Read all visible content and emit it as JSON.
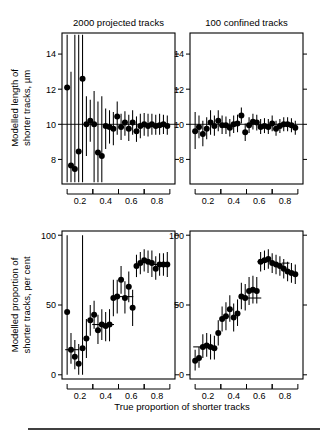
{
  "figure": {
    "xlabel": "True proportion of shorter tracks",
    "ylabel_top": "Modelled length of\nshorter tracks, µm",
    "ylabel_top_line1": "Modelled length of",
    "ylabel_top_line2": "shorter tracks, µm",
    "ylabel_bottom_line1": "Modelled proportion of",
    "ylabel_bottom_line2": "shorter tracks, per cent",
    "x_tick_labels": [
      "0.2",
      "0.4",
      "0.6",
      "0.8"
    ],
    "x_tick_values": [
      0.2,
      0.4,
      0.6,
      0.8
    ],
    "x_bracket_groups": [
      [
        0.1,
        0.3
      ],
      [
        0.3,
        0.5
      ],
      [
        0.5,
        0.7
      ],
      [
        0.7,
        0.9
      ]
    ],
    "xlim": [
      0.06,
      0.94
    ],
    "marker_color": "#000000",
    "line_color": "#000000",
    "background": "#ffffff"
  },
  "chart_data": [
    {
      "id": "top-left",
      "type": "scatter",
      "title": "2000 projected tracks",
      "xlabel": "True proportion of shorter tracks",
      "ylabel": "Modelled length of shorter tracks, µm",
      "xlim": [
        0.06,
        0.94
      ],
      "ylim": [
        6.6,
        15.2
      ],
      "yticks": [
        8,
        10,
        12,
        14
      ],
      "ytick_labels": [
        "8",
        "10",
        "12",
        "14"
      ],
      "grid": false,
      "legend": "none",
      "reference_line_y": 10,
      "x": [
        0.1,
        0.13,
        0.16,
        0.19,
        0.22,
        0.25,
        0.28,
        0.31,
        0.34,
        0.37,
        0.4,
        0.43,
        0.46,
        0.49,
        0.52,
        0.55,
        0.58,
        0.61,
        0.64,
        0.67,
        0.7,
        0.73,
        0.76,
        0.79,
        0.82,
        0.85,
        0.88
      ],
      "y": [
        12.1,
        7.65,
        7.45,
        8.45,
        12.6,
        10.0,
        10.2,
        10.0,
        8.4,
        8.2,
        9.9,
        9.85,
        9.75,
        10.45,
        9.85,
        10.1,
        9.75,
        10.1,
        9.6,
        9.9,
        10.0,
        9.9,
        10.0,
        9.9,
        9.95,
        10.0,
        9.9
      ],
      "y_err_low": [
        6.7,
        6.7,
        6.7,
        6.7,
        6.7,
        8.2,
        9.0,
        6.7,
        6.7,
        6.7,
        8.6,
        8.9,
        8.8,
        9.4,
        9.1,
        9.35,
        9.05,
        9.4,
        9.0,
        9.2,
        9.35,
        9.3,
        9.4,
        9.4,
        9.4,
        9.45,
        9.4
      ],
      "y_err_high": [
        15.1,
        13.0,
        15.1,
        15.1,
        15.1,
        11.6,
        11.4,
        11.9,
        11.3,
        11.6,
        10.9,
        10.8,
        10.7,
        11.3,
        10.6,
        10.75,
        10.55,
        10.8,
        10.45,
        10.6,
        10.65,
        10.6,
        10.6,
        10.55,
        10.6,
        10.55,
        10.5
      ]
    },
    {
      "id": "top-right",
      "type": "scatter",
      "title": "100 confined tracks",
      "xlabel": "True proportion of shorter tracks",
      "ylabel": "Modelled length of shorter tracks, µm",
      "xlim": [
        0.06,
        0.94
      ],
      "ylim": [
        6.6,
        15.2
      ],
      "yticks": [
        8,
        10,
        12,
        14
      ],
      "ytick_labels": [
        "8",
        "10",
        "12",
        "14"
      ],
      "grid": false,
      "legend": "none",
      "reference_line_y": 10,
      "x": [
        0.1,
        0.13,
        0.16,
        0.19,
        0.22,
        0.25,
        0.28,
        0.31,
        0.34,
        0.37,
        0.4,
        0.43,
        0.46,
        0.49,
        0.52,
        0.55,
        0.58,
        0.61,
        0.64,
        0.67,
        0.7,
        0.73,
        0.76,
        0.79,
        0.82,
        0.85,
        0.88
      ],
      "y": [
        9.6,
        9.85,
        9.45,
        9.75,
        10.1,
        9.9,
        10.2,
        9.95,
        9.95,
        9.8,
        10.0,
        10.05,
        10.5,
        9.55,
        9.95,
        10.15,
        10.1,
        9.85,
        9.9,
        9.85,
        10.05,
        9.75,
        9.9,
        10.0,
        10.0,
        9.95,
        9.8
      ],
      "y_err_low": [
        8.6,
        9.2,
        8.75,
        9.15,
        9.4,
        9.35,
        9.6,
        9.45,
        9.45,
        9.3,
        9.5,
        9.55,
        10.05,
        9.05,
        9.5,
        9.7,
        9.65,
        9.45,
        9.5,
        9.45,
        9.6,
        9.35,
        9.5,
        9.6,
        9.6,
        9.55,
        9.4
      ],
      "y_err_high": [
        10.7,
        10.5,
        10.2,
        10.4,
        10.8,
        10.5,
        10.8,
        10.5,
        10.45,
        10.3,
        10.5,
        10.55,
        10.95,
        10.05,
        10.4,
        10.6,
        10.55,
        10.3,
        10.35,
        10.3,
        10.5,
        10.2,
        10.3,
        10.4,
        10.4,
        10.35,
        10.2
      ]
    },
    {
      "id": "bottom-left",
      "type": "scatter",
      "title": "",
      "xlabel": "True proportion of shorter tracks",
      "ylabel": "Modelled proportion of shorter tracks, per cent",
      "xlim": [
        0.06,
        0.94
      ],
      "ylim": [
        -3,
        103
      ],
      "yticks": [
        0,
        50,
        100
      ],
      "ytick_labels": [
        "0",
        "50",
        "100"
      ],
      "grid": false,
      "legend": "none",
      "x": [
        0.1,
        0.13,
        0.16,
        0.19,
        0.22,
        0.25,
        0.28,
        0.31,
        0.34,
        0.37,
        0.4,
        0.43,
        0.46,
        0.49,
        0.52,
        0.55,
        0.58,
        0.61,
        0.64,
        0.67,
        0.7,
        0.73,
        0.76,
        0.79,
        0.82,
        0.85,
        0.88
      ],
      "y": [
        45,
        18,
        13,
        8,
        19,
        26,
        39,
        43,
        32,
        36,
        35,
        36,
        55,
        56,
        68,
        55,
        63,
        48,
        78,
        80,
        82,
        81,
        80,
        76,
        79,
        79,
        79
      ],
      "y_err_low": [
        0,
        8,
        4,
        0,
        0,
        12,
        28,
        33,
        22,
        25,
        24,
        24,
        42,
        44,
        58,
        44,
        52,
        35,
        70,
        72,
        74,
        73,
        70,
        68,
        71,
        71,
        70
      ],
      "y_err_high": [
        100,
        30,
        25,
        22,
        100,
        40,
        50,
        53,
        43,
        47,
        45,
        47,
        68,
        68,
        78,
        67,
        74,
        61,
        86,
        88,
        90,
        89,
        89,
        85,
        87,
        87,
        88
      ],
      "h_bars": [
        {
          "y": 18,
          "x_start": 0.085,
          "x_end": 0.195
        },
        {
          "y": 36,
          "x_start": 0.295,
          "x_end": 0.405
        },
        {
          "y": 36,
          "x_start": 0.405,
          "x_end": 0.465
        },
        {
          "y": 56,
          "x_start": 0.495,
          "x_end": 0.615
        },
        {
          "y": 79,
          "x_start": 0.775,
          "x_end": 0.895
        }
      ]
    },
    {
      "id": "bottom-right",
      "type": "scatter",
      "title": "",
      "xlabel": "True proportion of shorter tracks",
      "ylabel": "Modelled proportion of shorter tracks, per cent",
      "xlim": [
        0.06,
        0.94
      ],
      "ylim": [
        -3,
        103
      ],
      "yticks": [
        0,
        50,
        100
      ],
      "ytick_labels": [
        "0",
        "50",
        "100"
      ],
      "grid": false,
      "legend": "none",
      "x": [
        0.1,
        0.13,
        0.16,
        0.19,
        0.22,
        0.25,
        0.28,
        0.31,
        0.34,
        0.37,
        0.4,
        0.43,
        0.46,
        0.49,
        0.52,
        0.55,
        0.58,
        0.61,
        0.64,
        0.67,
        0.7,
        0.73,
        0.76,
        0.79,
        0.82,
        0.85,
        0.88
      ],
      "y": [
        10,
        12,
        20,
        21,
        20,
        19,
        30,
        40,
        42,
        47,
        41,
        44,
        56,
        55,
        60,
        61,
        60,
        81,
        82,
        83,
        80,
        79,
        78,
        76,
        74,
        73,
        72
      ],
      "y_err_low": [
        3,
        5,
        12,
        13,
        11,
        11,
        21,
        31,
        32,
        38,
        31,
        35,
        47,
        46,
        50,
        51,
        51,
        74,
        75,
        76,
        73,
        72,
        71,
        69,
        67,
        66,
        65
      ],
      "y_err_high": [
        18,
        20,
        29,
        30,
        29,
        28,
        39,
        49,
        52,
        57,
        51,
        54,
        66,
        65,
        70,
        71,
        70,
        88,
        89,
        90,
        87,
        86,
        85,
        83,
        81,
        80,
        79
      ],
      "h_bars": [
        {
          "y": 20,
          "x_start": 0.085,
          "x_end": 0.195
        },
        {
          "y": 55,
          "x_start": 0.495,
          "x_end": 0.615
        },
        {
          "y": 81,
          "x_start": 0.585,
          "x_end": 0.675
        },
        {
          "y": 80,
          "x_start": 0.775,
          "x_end": 0.835
        }
      ]
    }
  ]
}
